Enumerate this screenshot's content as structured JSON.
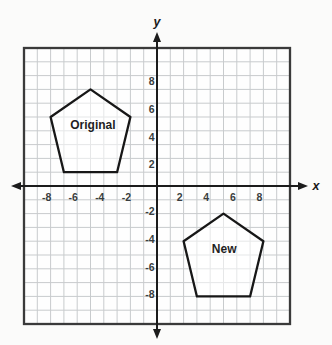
{
  "figure": {
    "axes": {
      "x_label": "x",
      "y_label": "y",
      "x_range": [
        -10,
        10
      ],
      "y_range": [
        -10,
        10
      ],
      "x_ticks": [
        -8,
        -6,
        -4,
        -2,
        2,
        4,
        6,
        8
      ],
      "y_ticks": [
        8,
        6,
        4,
        2,
        -2,
        -4,
        -6,
        -8
      ],
      "grid_step": 1
    },
    "shapes": [
      {
        "name": "original-pentagon",
        "label": "Original",
        "label_pos": [
          -4.82,
          4.42
        ],
        "vertices": [
          [
            -5,
            7
          ],
          [
            -2,
            5
          ],
          [
            -3,
            1
          ],
          [
            -7,
            1
          ],
          [
            -8,
            5
          ]
        ]
      },
      {
        "name": "new-pentagon",
        "label": "New",
        "label_pos": [
          5.05,
          -4.51
        ],
        "vertices": [
          [
            5,
            -2
          ],
          [
            8,
            -4
          ],
          [
            7,
            -8
          ],
          [
            3,
            -8
          ],
          [
            2,
            -4
          ]
        ]
      }
    ],
    "colors": {
      "page_bg": "#fbfbfa",
      "plot_bg": "#fefefe",
      "grid": "#c8cbcd",
      "border": "#3a3a3a",
      "axis": "#1c1c1c",
      "shape_stroke": "#171717",
      "shape_fill": "rgba(255,255,255,0.55)",
      "tick_text": "#3a3e40",
      "label_text": "#1f1f1f"
    }
  },
  "chart_data": {
    "type": "line",
    "title": "",
    "xlabel": "x",
    "ylabel": "y",
    "xlim": [
      -10,
      10
    ],
    "ylim": [
      -10,
      10
    ],
    "grid": true,
    "x_ticks": [
      -8,
      -6,
      -4,
      -2,
      2,
      4,
      6,
      8
    ],
    "y_ticks": [
      -8,
      -6,
      -4,
      -2,
      2,
      4,
      6,
      8
    ],
    "series": [
      {
        "name": "Original",
        "closed": true,
        "points": [
          [
            -5,
            7
          ],
          [
            -2,
            5
          ],
          [
            -3,
            1
          ],
          [
            -7,
            1
          ],
          [
            -8,
            5
          ]
        ]
      },
      {
        "name": "New",
        "closed": true,
        "points": [
          [
            5,
            -2
          ],
          [
            8,
            -4
          ],
          [
            7,
            -8
          ],
          [
            3,
            -8
          ],
          [
            2,
            -4
          ]
        ]
      }
    ]
  }
}
